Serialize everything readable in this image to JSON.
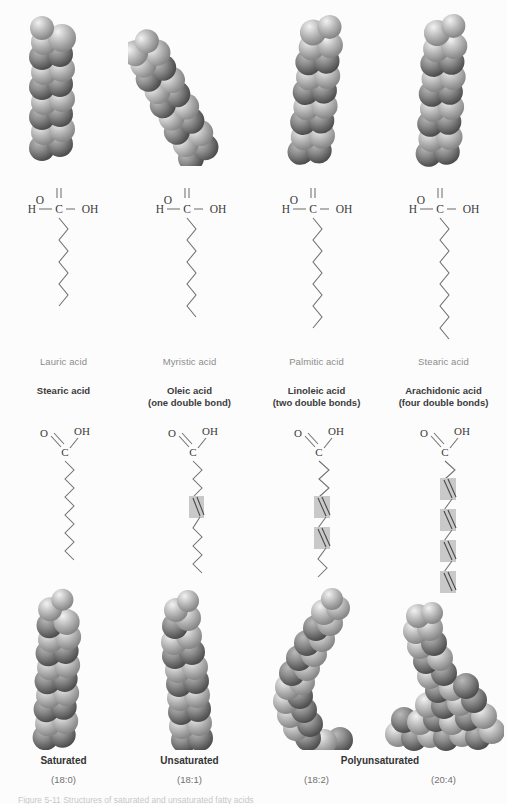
{
  "figure": {
    "caption": "Figure 5-11  Structures of saturated and unsaturated fatty acids",
    "background_color": "#fcfcfc",
    "bond_color": "#6f6f6f",
    "highlight_color": "#c9c9c9"
  },
  "row1": {
    "kind": "saturated-fatty-acids-space-filling-and-skeletal",
    "columns": [
      {
        "label": "Lauric acid",
        "carbons": 12,
        "notation": "12:0",
        "model_orientation": "vertical-straight",
        "chain_zigzag_segments": 11,
        "carboxyl": {
          "h": "H",
          "c": "C",
          "o": "O",
          "oh": "OH"
        }
      },
      {
        "label": "Myristic acid",
        "carbons": 14,
        "notation": "14:0",
        "model_orientation": "diagonal-tilted",
        "chain_zigzag_segments": 13,
        "carboxyl": {
          "h": "H",
          "c": "C",
          "o": "O",
          "oh": "OH"
        }
      },
      {
        "label": "Palmitic acid",
        "carbons": 16,
        "notation": "16:0",
        "model_orientation": "vertical-slight-tilt",
        "chain_zigzag_segments": 15,
        "carboxyl": {
          "h": "H",
          "c": "C",
          "o": "O",
          "oh": "OH"
        }
      },
      {
        "label": "Stearic acid",
        "carbons": 18,
        "notation": "18:0",
        "model_orientation": "vertical-straight",
        "chain_zigzag_segments": 17,
        "carboxyl": {
          "h": "H",
          "c": "C",
          "o": "O",
          "oh": "OH"
        }
      }
    ]
  },
  "row2": {
    "kind": "skeletal-formulas-and-space-filling-models",
    "columns": [
      {
        "label": "Stearic acid",
        "sublabel": "",
        "double_bonds": 0,
        "notation": "(18:0)",
        "bottom_label": "Saturated",
        "carboxyl": {
          "o": "O",
          "c": "C",
          "oh": "OH"
        },
        "model_shape": "straight-rod"
      },
      {
        "label": "Oleic acid",
        "sublabel": "(one double bond)",
        "double_bonds": 1,
        "notation": "(18:1)",
        "bottom_label": "Unsaturated",
        "carboxyl": {
          "o": "O",
          "c": "C",
          "oh": "OH"
        },
        "model_shape": "single-kink"
      },
      {
        "label": "Linoleic acid",
        "sublabel": "(two double bonds)",
        "double_bonds": 2,
        "notation": "(18:2)",
        "bottom_label": "Polyunsaturated",
        "carboxyl": {
          "o": "O",
          "c": "C",
          "oh": "OH"
        },
        "model_shape": "curved-hook"
      },
      {
        "label": "Arachidonic acid",
        "sublabel": "(four double bonds)",
        "double_bonds": 4,
        "notation": "(20:4)",
        "bottom_label": "",
        "carboxyl": {
          "o": "O",
          "c": "C",
          "oh": "OH"
        },
        "model_shape": "sharp-L-bend"
      }
    ],
    "bottom_labels": [
      {
        "text": "Saturated",
        "span": 1
      },
      {
        "text": "Unsaturated",
        "span": 1
      },
      {
        "text": "Polyunsaturated",
        "span": 2
      }
    ]
  }
}
